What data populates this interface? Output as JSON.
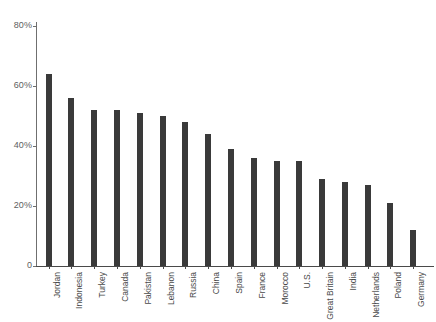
{
  "chart_data": {
    "type": "bar",
    "title": "",
    "subtitle": "",
    "xlabel": "",
    "ylabel": "",
    "ylim": [
      0,
      80
    ],
    "grid": false,
    "legend": "none",
    "value_suffix": "%",
    "ytick_labels": [
      "0",
      "20%",
      "40%",
      "60%",
      "80%"
    ],
    "yticks": [
      0,
      20,
      40,
      60,
      80
    ],
    "categories": [
      "Jordan",
      "Indonesia",
      "Turkey",
      "Canada",
      "Pakistan",
      "Lebanon",
      "Russia",
      "China",
      "Spain",
      "France",
      "Morocco",
      "U.S.",
      "Great Britain",
      "India",
      "Netherlands",
      "Poland",
      "Germany"
    ],
    "values": [
      64,
      56,
      52,
      52,
      51,
      50,
      48,
      44,
      39,
      36,
      35,
      35,
      29,
      28,
      27,
      21,
      12
    ],
    "bar_color": "#3a3a3a",
    "axis_color": "#4a4a4a",
    "background_color": "#ffffff"
  }
}
